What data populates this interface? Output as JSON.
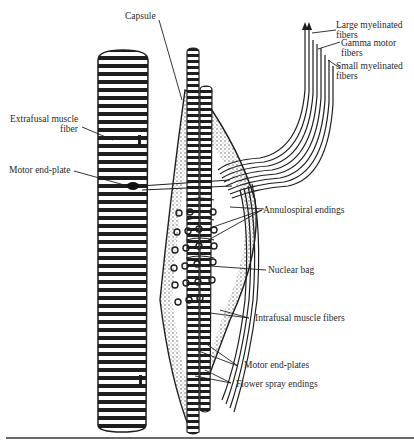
{
  "figure": {
    "labels": {
      "capsule": "Capsule",
      "large_myelinated_1": "Large myelinated",
      "large_myelinated_2": "fibers",
      "gamma_motor_1": "Gamma motor",
      "gamma_motor_2": "fibers",
      "small_myelinated_1": "Small myelinated",
      "small_myelinated_2": "fibers",
      "extrafusal_1": "Extrafusal muscle",
      "extrafusal_2": "fiber",
      "motor_end_plate": "Motor end-plate",
      "annulospiral": "Annulospiral endings",
      "nuclear_bag": "Nuclear bag",
      "intrafusal": "Intrafusal muscle fibers",
      "motor_end_plates": "Motor end-plates",
      "flower_spray": "Flower spray endings"
    },
    "colors": {
      "ink": "#1e1e1e",
      "paper": "#ffffff",
      "rule": "#6a6a6a"
    }
  }
}
